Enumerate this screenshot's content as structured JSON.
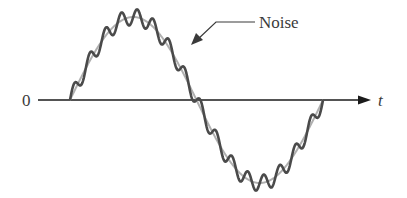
{
  "diagram": {
    "title": "",
    "origin_label": "0",
    "axis_label": "t",
    "annotation": "Noise",
    "colors": {
      "axis": "#1a1a1a",
      "clean_signal": "#b0b0b0",
      "noisy_signal": "#4a4a4a",
      "annotation": "#3a3a3a"
    },
    "signal": {
      "description": "One full sine cycle with superimposed high-frequency noise",
      "start_x": 70,
      "end_x": 323,
      "baseline_y": 100,
      "amplitude_px": 83,
      "noise_cycles": 16,
      "noise_amplitude_px": 8
    }
  }
}
